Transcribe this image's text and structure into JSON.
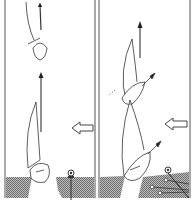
{
  "figure": {
    "panels": [
      {
        "id": "left",
        "wind_direction": "from-right",
        "boats": 2,
        "dock": "straight-pier",
        "mooring": "single-post"
      },
      {
        "id": "right",
        "wind_direction": "from-right",
        "boats": 2,
        "dock": "angled-pier",
        "mooring": "post-with-lines"
      }
    ],
    "colors": {
      "ink": "#333333",
      "water_hatch": "#8a8a8a",
      "background": "#ffffff"
    },
    "icons": {
      "wind": "hollow-arrow-left",
      "heading": "arrow-up"
    }
  }
}
